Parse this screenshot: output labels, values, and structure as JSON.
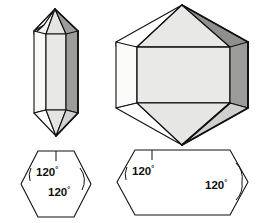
{
  "figure": {
    "background_color": "#ffffff",
    "outline_color": "#111111"
  },
  "palette": {
    "face_white": "#f7f7f5",
    "face_light": "#e8e8e6",
    "face_mid": "#d6d6d4",
    "face_dark": "#9c9c9a",
    "face_darker": "#8a8a88",
    "outline": "#111111"
  },
  "crystals": [
    {
      "id": "prismatic-crystal",
      "name": "Elongated hexagonal prism with pyramidal terminations",
      "faces": [
        {
          "name": "left-prism-face",
          "shade": "#f7f7f5"
        },
        {
          "name": "front-prism-face",
          "shade": "#e8e8e6"
        },
        {
          "name": "right-prism-face",
          "shade": "#9c9c9a"
        },
        {
          "name": "top-pyramid-left-face",
          "shade": "#ffffff"
        },
        {
          "name": "top-pyramid-front-face",
          "shade": "#e8e8e6"
        },
        {
          "name": "top-pyramid-right-face",
          "shade": "#9c9c9a"
        },
        {
          "name": "bottom-pyramid-front-face",
          "shade": "#e8e8e6"
        },
        {
          "name": "bottom-pyramid-right-face",
          "shade": "#d6d6d4"
        }
      ]
    },
    {
      "id": "equant-crystal",
      "name": "Equant hexagonal prism with pyramidal terminations",
      "faces": [
        {
          "name": "left-prism-face",
          "shade": "#f7f7f5"
        },
        {
          "name": "front-prism-face",
          "shade": "#e8e8e6"
        },
        {
          "name": "right-prism-face",
          "shade": "#9c9c9a"
        },
        {
          "name": "top-pyramid-left-face",
          "shade": "#ffffff"
        },
        {
          "name": "top-pyramid-front-face",
          "shade": "#e8e8e6"
        },
        {
          "name": "top-pyramid-right-face",
          "shade": "#8a8a88"
        },
        {
          "name": "bottom-pyramid-front-face",
          "shade": "#e8e8e6"
        },
        {
          "name": "bottom-pyramid-right-face",
          "shade": "#d6d6d4"
        }
      ]
    }
  ],
  "cross_sections": [
    {
      "id": "regular-hexagon-section",
      "name": "Regular hexagonal cross section",
      "angle_labels": [
        {
          "value": "120",
          "degree_symbol": "°"
        },
        {
          "value": "120",
          "degree_symbol": "°"
        }
      ]
    },
    {
      "id": "elongated-hexagon-section",
      "name": "Elongated hexagonal cross section",
      "angle_labels": [
        {
          "value": "120",
          "degree_symbol": "°"
        },
        {
          "value": "120",
          "degree_symbol": "°"
        }
      ]
    }
  ]
}
